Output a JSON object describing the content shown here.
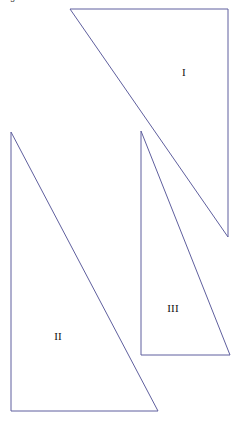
{
  "caption": {
    "text": "angle/dilation of rotation"
  },
  "figure": {
    "title": "",
    "stroke_color": "#5f5f9e",
    "fill_color": "#ffffff",
    "stroke_width": 1,
    "width": 239,
    "height": 424,
    "triangles": [
      {
        "label": "I",
        "label_x": 184,
        "label_y": 72,
        "points": "70,9 228,9 228,237",
        "vertices": [
          [
            70,
            9
          ],
          [
            228,
            9
          ],
          [
            228,
            237
          ]
        ]
      },
      {
        "label": "II",
        "label_x": 58,
        "label_y": 336,
        "points": "11,132 11,411 158,411",
        "vertices": [
          [
            11,
            132
          ],
          [
            11,
            411
          ],
          [
            158,
            411
          ]
        ]
      },
      {
        "label": "III",
        "label_x": 173,
        "label_y": 308,
        "points": "141,131 141,355 230,355",
        "vertices": [
          [
            141,
            131
          ],
          [
            141,
            355
          ],
          [
            230,
            355
          ]
        ]
      }
    ]
  }
}
